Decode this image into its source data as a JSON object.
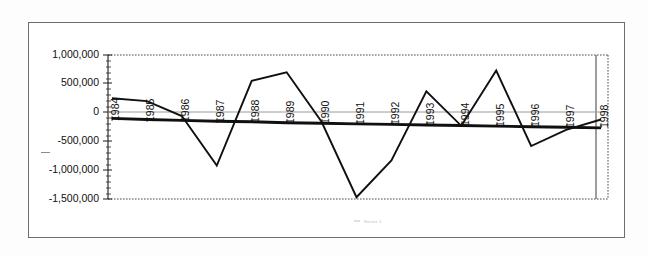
{
  "chart_data": {
    "type": "line",
    "title": "",
    "subtitle": "",
    "xlabel": "",
    "ylabel": "",
    "categories": [
      "1984",
      "1985",
      "1986",
      "1987",
      "1988",
      "1989",
      "1990",
      "1991",
      "1992",
      "1993",
      "1994",
      "1995",
      "1996",
      "1997",
      "1998"
    ],
    "series": [
      {
        "name": "Series 1",
        "values": [
          250000,
          200000,
          -60000,
          -920000,
          550000,
          700000,
          -160000,
          -1470000,
          -830000,
          370000,
          -230000,
          730000,
          -580000,
          -300000,
          -120000
        ]
      },
      {
        "name": "Trend",
        "values": [
          -100000,
          -120000,
          -135000,
          -150000,
          -160000,
          -175000,
          -185000,
          -195000,
          -205000,
          -215000,
          -225000,
          -235000,
          -245000,
          -255000,
          -265000
        ]
      }
    ],
    "ylim": [
      -1500000,
      1000000
    ],
    "yticks": [
      1000000,
      500000,
      0,
      -500000,
      -1000000,
      -1500000
    ],
    "ytick_labels": [
      "1,000,000",
      "500,000",
      "0",
      "-500,000",
      "-1,000,000",
      "-1,500,000"
    ],
    "grid": false,
    "legend_position": "bottom",
    "legend_entries": [
      "Series 1"
    ],
    "legend_text_legible": false,
    "colors": {
      "series_main": "#101010",
      "series_trend": "#101010",
      "zero_line": "#9a9a9a",
      "frame": "#3c3c3c",
      "background": "#ffffff"
    }
  }
}
